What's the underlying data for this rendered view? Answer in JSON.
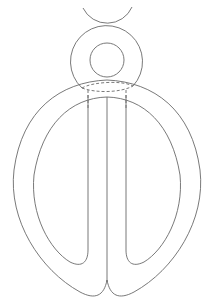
{
  "diagram": {
    "type": "line-drawing",
    "stroke_color": "#6a6a6a",
    "background": "#ffffff",
    "elements": [
      {
        "name": "top-arc",
        "kind": "arc"
      },
      {
        "name": "ring-outer",
        "kind": "circle"
      },
      {
        "name": "ring-inner",
        "kind": "circle"
      },
      {
        "name": "loop-outer",
        "kind": "path"
      },
      {
        "name": "loop-inner-left",
        "kind": "path"
      },
      {
        "name": "loop-inner-right",
        "kind": "path"
      },
      {
        "name": "vertical-strands",
        "kind": "lines",
        "count": 3
      },
      {
        "name": "crossing-dashed",
        "kind": "dashed-lines"
      }
    ]
  }
}
